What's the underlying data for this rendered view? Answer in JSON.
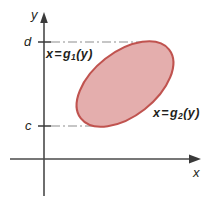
{
  "figure": {
    "type": "math-diagram",
    "background_color": "#ffffff",
    "axes": {
      "color": "#3a3a3a",
      "x_axis_label": "x",
      "y_axis_label": "y",
      "x_axis_y_px": 159,
      "y_axis_x_px": 44,
      "x_axis_arrow": "right-arrow-head",
      "y_axis_arrow": "up-arrow-head"
    },
    "ticks": [
      {
        "name": "d",
        "label": "d",
        "y_px": 42,
        "guide": "dash-dot",
        "guide_to_x_px": 152
      },
      {
        "name": "c",
        "label": "c",
        "y_px": 126,
        "guide": "dash-dot",
        "guide_to_x_px": 100
      }
    ],
    "region": {
      "shape": "ellipse",
      "fill_color": "#e4aead",
      "stroke_color": "#c0534f",
      "center_x_px": 125,
      "center_y_px": 84,
      "radius_x_px": 56,
      "radius_y_px": 32,
      "rotation_deg": -38
    },
    "annotations": [
      {
        "name": "left-boundary-label",
        "variable": "x",
        "equals": "=",
        "function": "g",
        "subscript": "1",
        "argument": "(y)",
        "text": "x = g1(y)",
        "x_px": 44,
        "y_px": 47
      },
      {
        "name": "right-boundary-label",
        "variable": "x",
        "equals": "=",
        "function": "g",
        "subscript": "2",
        "argument": "(y)",
        "text": "x = g2(y)",
        "x_px": 152,
        "y_px": 106
      }
    ]
  }
}
